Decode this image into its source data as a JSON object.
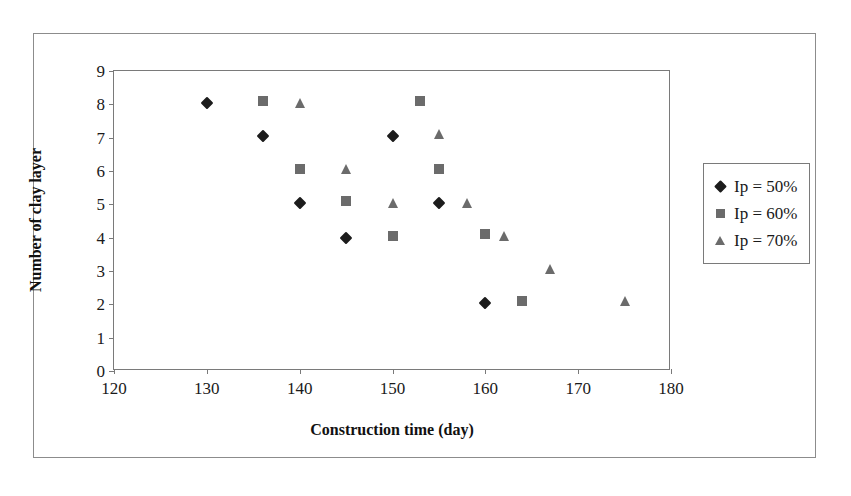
{
  "chart_data": {
    "type": "scatter",
    "title": "",
    "xlabel": "Construction time (day)",
    "ylabel": "Number of clay layer",
    "xlim": [
      120,
      180
    ],
    "ylim": [
      0,
      9
    ],
    "xticks": [
      120,
      130,
      140,
      150,
      160,
      170,
      180
    ],
    "yticks": [
      0,
      1,
      2,
      3,
      4,
      5,
      6,
      7,
      8,
      9
    ],
    "grid": false,
    "legend_position": "right",
    "series": [
      {
        "name": "Ip = 50%",
        "marker": "diamond",
        "color": "#1c1c1c",
        "points": [
          [
            130,
            8.05
          ],
          [
            136,
            7.05
          ],
          [
            140,
            5.05
          ],
          [
            145,
            4.0
          ],
          [
            150,
            7.05
          ],
          [
            155,
            5.05
          ],
          [
            160,
            2.05
          ]
        ]
      },
      {
        "name": "Ip = 60%",
        "marker": "square",
        "color": "#6b6b6b",
        "points": [
          [
            136,
            8.1
          ],
          [
            140,
            6.05
          ],
          [
            145,
            5.1
          ],
          [
            150,
            4.05
          ],
          [
            153,
            8.1
          ],
          [
            155,
            6.05
          ],
          [
            160,
            4.1
          ],
          [
            164,
            2.1
          ]
        ]
      },
      {
        "name": "Ip = 70%",
        "marker": "triangle",
        "color": "#6b6b6b",
        "points": [
          [
            140,
            8.05
          ],
          [
            145,
            6.05
          ],
          [
            150,
            5.05
          ],
          [
            155,
            7.1
          ],
          [
            158,
            5.05
          ],
          [
            162,
            4.05
          ],
          [
            167,
            3.05
          ],
          [
            175,
            2.1
          ]
        ]
      }
    ]
  },
  "legend": {
    "items": [
      {
        "label": "Ip = 50%",
        "marker": "diamond"
      },
      {
        "label": "Ip = 60%",
        "marker": "square"
      },
      {
        "label": "Ip = 70%",
        "marker": "triangle"
      }
    ]
  },
  "axes": {
    "x_title": "Construction time (day)",
    "y_title": "Number of clay layer"
  }
}
